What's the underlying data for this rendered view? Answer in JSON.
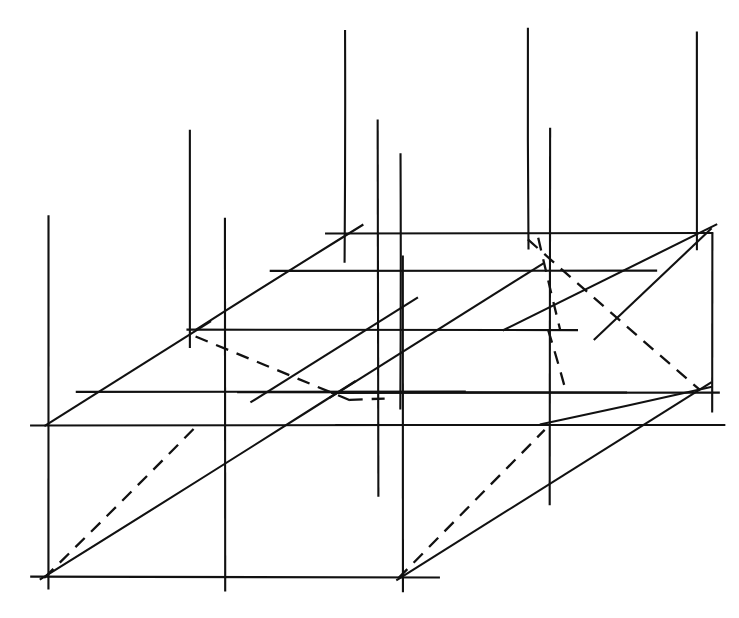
{
  "figure": {
    "title": "Oblique projection of a parallelepiped lattice",
    "canvas": {
      "width": 739,
      "height": 618
    },
    "background_color": "#ffffff",
    "ink_color": "#111111",
    "stroke_width_solid": 2.1,
    "stroke_width_dashed": 2.3,
    "dash_pattern": "13 9"
  },
  "chart_data": {
    "type": "line",
    "title": "Oblique projection of a parallelepiped lattice",
    "xlabel": "",
    "ylabel": "",
    "xlim": [
      0,
      739
    ],
    "ylim": [
      0,
      618
    ],
    "grid": false,
    "legend": "none",
    "note": "Coordinates are image pixels with origin at top-left; y increases downward.",
    "series": [
      {
        "name": "horizontal-rails",
        "style": "solid",
        "segments": [
          [
            325,
            233,
            713,
            233
          ],
          [
            270,
            271,
            657,
            271
          ],
          [
            186,
            330,
            578,
            330
          ],
          [
            76,
            392,
            466,
            392
          ],
          [
            237,
            392,
            627,
            392
          ],
          [
            331,
            393,
            720,
            393
          ],
          [
            30,
            425,
            420,
            425
          ],
          [
            335,
            425,
            725,
            425
          ],
          [
            30,
            577,
            440,
            577
          ]
        ]
      },
      {
        "name": "vertical-posts",
        "style": "solid",
        "segments": [
          [
            48,
            215,
            48,
            590
          ],
          [
            190,
            130,
            190,
            348
          ],
          [
            225,
            218,
            225,
            592
          ],
          [
            345,
            30,
            345,
            263
          ],
          [
            378,
            120,
            378,
            497
          ],
          [
            400,
            153,
            400,
            410
          ],
          [
            403,
            255,
            403,
            592
          ],
          [
            528,
            28,
            528,
            250
          ],
          [
            550,
            128,
            550,
            505
          ],
          [
            697,
            32,
            697,
            250
          ],
          [
            712,
            232,
            712,
            412
          ]
        ]
      },
      {
        "name": "depth-diagonals",
        "style": "solid",
        "segments": [
          [
            196,
            330,
            363,
            225
          ],
          [
            44,
            426,
            211,
            321
          ],
          [
            40,
            580,
            356,
            381
          ],
          [
            250,
            402,
            418,
            297
          ],
          [
            330,
            398,
            545,
            262
          ],
          [
            396,
            580,
            712,
            382
          ],
          [
            503,
            330,
            717,
            224
          ],
          [
            594,
            340,
            712,
            228
          ],
          [
            540,
            425,
            712,
            387
          ]
        ]
      },
      {
        "name": "hidden-dashed",
        "style": "dashed",
        "segments": [
          [
            44,
            578,
            196,
            427
          ],
          [
            196,
            336,
            350,
            400
          ],
          [
            350,
            400,
            390,
            398
          ],
          [
            528,
            239,
            700,
            390
          ],
          [
            538,
            238,
            560,
            330
          ],
          [
            548,
            330,
            566,
            392
          ],
          [
            398,
            578,
            545,
            430
          ]
        ]
      }
    ]
  },
  "elements": {
    "horizontal_rail_label": "horizontal lattice rail",
    "vertical_post_label": "vertical lattice post",
    "depth_diagonal_label": "receding depth edge",
    "hidden_dashed_label": "hidden construction line"
  }
}
